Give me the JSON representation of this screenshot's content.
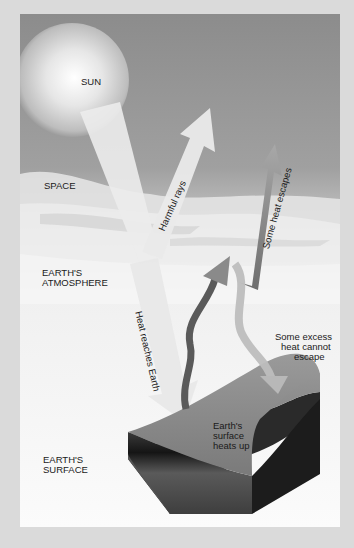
{
  "labels": {
    "sun": "SUN",
    "space": "SPACE",
    "atmosphere_line1": "EARTH'S",
    "atmosphere_line2": "ATMOSPHERE",
    "surface_line1": "EARTH'S",
    "surface_line2": "SURFACE"
  },
  "arrows": {
    "harmful_rays": "Harmful rays",
    "heat_reaches_earth": "Heat reaches Earth",
    "some_heat_escapes": "Some heat escapes"
  },
  "annotations": {
    "excess_line1": "Some excess",
    "excess_line2": "heat cannot",
    "excess_line3": "escape",
    "surface_heats_line1": "Earth's",
    "surface_heats_line2": "surface",
    "surface_heats_line3": "heats up"
  },
  "colors": {
    "outer_background": "#dadada",
    "space": "#8e8e8e",
    "atmosphere": "#f2f2f2",
    "ground_top": "#8a8a8a",
    "ground_side": "#1e1e1e",
    "arrow_light": "#e6e6e6",
    "arrow_dark": "#6a6a6a"
  }
}
